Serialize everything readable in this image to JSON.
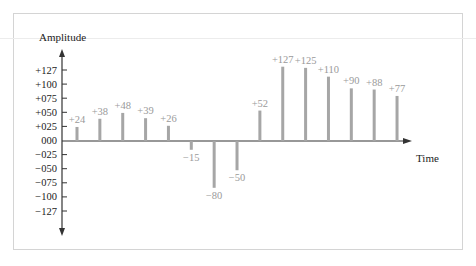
{
  "chart_data": {
    "type": "bar",
    "subtype": "stem",
    "title": "",
    "xlabel": "Time",
    "ylabel": "Amplitude",
    "y_tick_labels": [
      "+127",
      "+100",
      "+075",
      "+050",
      "+025",
      "000",
      "−025",
      "−050",
      "−075",
      "−100",
      "−127"
    ],
    "ylim": [
      -127,
      127
    ],
    "grid": false,
    "legend": null,
    "values": [
      24,
      38,
      48,
      39,
      26,
      -15,
      -80,
      -50,
      52,
      127,
      125,
      110,
      90,
      88,
      77
    ],
    "value_labels": [
      "+24",
      "+38",
      "+48",
      "+39",
      "+26",
      "−15",
      "−80",
      "−50",
      "+52",
      "+127",
      "+125",
      "+110",
      "+90",
      "+88",
      "+77"
    ]
  },
  "colors": {
    "bar": "#a6a6a6",
    "axis": "#333333",
    "value_label": "#9a9a9a",
    "frame": "#d4d4d4"
  }
}
